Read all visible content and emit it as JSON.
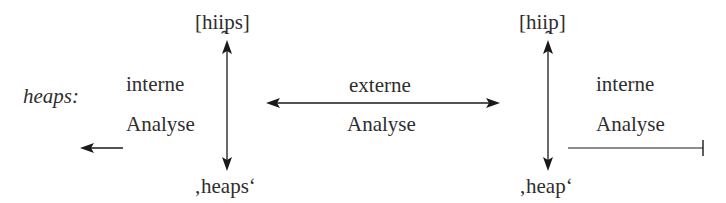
{
  "diagram": {
    "word_label": "heaps:",
    "left_column": {
      "phonetic": "[hii̯ps]",
      "meaning": "‚heaps‘",
      "internal_analysis": {
        "line1": "interne",
        "line2": "Analyse"
      }
    },
    "middle": {
      "external_analysis": {
        "line1": "externe",
        "line2": "Analyse"
      }
    },
    "right_column": {
      "phonetic": "[hii̯p]",
      "meaning": "‚heap‘",
      "internal_analysis": {
        "line1": "interne",
        "line2": "Analyse"
      }
    },
    "arrows": [
      {
        "name": "left-vertical-double-arrow",
        "from": "[hii̯ps]",
        "to": "‚heaps‘",
        "type": "bidirectional"
      },
      {
        "name": "external-horizontal-double-arrow",
        "from": "left column",
        "to": "right column",
        "type": "bidirectional"
      },
      {
        "name": "right-vertical-double-arrow",
        "from": "[hii̯p]",
        "to": "‚heap‘",
        "type": "bidirectional"
      },
      {
        "name": "left-output-arrow",
        "direction": "left",
        "type": "arrow"
      },
      {
        "name": "right-input-line",
        "type": "line-with-bar-end"
      }
    ],
    "colors": {
      "text": "#2e2e2e",
      "lines": "#1a1a1a",
      "background": "#ffffff"
    }
  }
}
